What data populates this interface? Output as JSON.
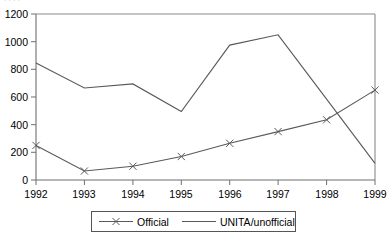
{
  "clipped_top_caption": ". . . .",
  "chart_data": {
    "type": "line",
    "title": "",
    "subtitle": "",
    "xlabel": "",
    "ylabel": "",
    "categories": [
      "1992",
      "1993",
      "1994",
      "1995",
      "1996",
      "1997",
      "1998",
      "1999"
    ],
    "x": [
      1992,
      1993,
      1994,
      1995,
      1996,
      1997,
      1998,
      1999
    ],
    "xlim": [
      1992,
      1999
    ],
    "ylim": [
      0,
      1200
    ],
    "yticks": [
      0,
      200,
      400,
      600,
      800,
      1000,
      1200
    ],
    "ytick_labels": [
      "0",
      "200",
      "400",
      "600",
      "800",
      "1000",
      "1200"
    ],
    "xtick_labels": [
      "1992",
      "1993",
      "1994",
      "1995",
      "1996",
      "1997",
      "1998",
      "1999"
    ],
    "grid": false,
    "legend_position": "bottom-center",
    "series": [
      {
        "name": "Official",
        "marker": "x",
        "color": "#595959",
        "values": [
          250,
          65,
          100,
          170,
          265,
          350,
          435,
          650
        ]
      },
      {
        "name": "UNITA/unofficial",
        "marker": "none",
        "color": "#595959",
        "values": [
          845,
          665,
          695,
          495,
          975,
          1050,
          585,
          120
        ]
      }
    ],
    "annotations": []
  },
  "legend": {
    "entries": [
      {
        "label": "Official",
        "marker": "x"
      },
      {
        "label": "UNITA/unofficial",
        "marker": "none"
      }
    ]
  },
  "colors": {
    "line": "#595959",
    "axis": "#6f6f6f",
    "legend_border": "#555555",
    "background": "#ffffff"
  }
}
